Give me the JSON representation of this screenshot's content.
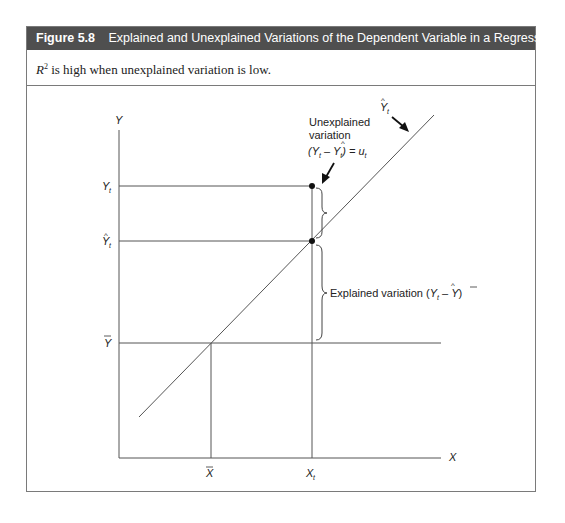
{
  "figure": {
    "number": "Figure 5.8",
    "title": "Explained and Unexplained Variations of the Dependent Variable in a Regression Model",
    "subtitle_symbol": "R",
    "subtitle_exponent": "2",
    "subtitle_text": " is high when unexplained variation is low.",
    "header_color": "#4f4f4f"
  },
  "diagram": {
    "axes": {
      "y_label": "Y",
      "x_label": "X"
    },
    "y_ticks": {
      "y_t": "Y",
      "y_t_sub": "t",
      "y_hat": "Y",
      "y_hat_sub": "t",
      "y_bar": "Y"
    },
    "x_ticks": {
      "x_bar": "X",
      "x_t": "X",
      "x_t_sub": "t"
    },
    "regression_line_label": {
      "main": "Y",
      "sub": "t"
    },
    "unexplained": {
      "line1": "Unexplained",
      "line2": "variation",
      "formula_open": "(Y",
      "formula_sub1": "t",
      "formula_minus": " – Y",
      "formula_sub2": "t",
      "formula_close": ") = u",
      "formula_sub3": "t"
    },
    "explained": {
      "text": "Explained variation (",
      "y_hat": "Y",
      "y_hat_sub": "t",
      "minus": " – ",
      "y_bar": "Y",
      "close": ")"
    }
  }
}
